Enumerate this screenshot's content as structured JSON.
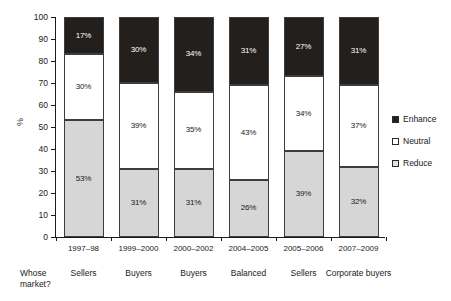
{
  "chart_data": {
    "type": "bar",
    "title": "",
    "subtitle": "",
    "xlabel": "",
    "ylabel": "%",
    "ylim": [
      0,
      100
    ],
    "ytick_step": 10,
    "yticks": [
      0,
      10,
      20,
      30,
      40,
      50,
      60,
      70,
      80,
      90,
      100
    ],
    "ytick_labels": [
      "0",
      "10",
      "20",
      "30",
      "40",
      "50",
      "60",
      "70",
      "80",
      "90",
      "100"
    ],
    "grid": false,
    "stacked": true,
    "stack_order_bottom_to_top": [
      "Reduce",
      "Neutral",
      "Enhance"
    ],
    "legend_position": "right",
    "categories": [
      "1997–98",
      "1999–2000",
      "2000–2002",
      "2004–2005",
      "2005–2006",
      "2007–2009"
    ],
    "series": [
      {
        "name": "Enhance",
        "color": "#231f1d",
        "values": [
          17,
          30,
          34,
          31,
          27,
          31
        ],
        "labels": [
          "17%",
          "30%",
          "34%",
          "31%",
          "27%",
          "31%"
        ]
      },
      {
        "name": "Neutral",
        "color": "#ffffff",
        "values": [
          30,
          39,
          35,
          43,
          34,
          37
        ],
        "labels": [
          "30%",
          "39%",
          "35%",
          "43%",
          "34%",
          "37%"
        ]
      },
      {
        "name": "Reduce",
        "color": "#d6d6d6",
        "values": [
          53,
          31,
          31,
          26,
          39,
          32
        ],
        "labels": [
          "53%",
          "31%",
          "31%",
          "26%",
          "39%",
          "32%"
        ]
      }
    ]
  },
  "footer": {
    "title": "Whose market?",
    "cells": [
      "Sellers",
      "Buyers",
      "Buyers",
      "Balanced",
      "Sellers",
      "Corporate buyers"
    ]
  },
  "legend": {
    "items": [
      {
        "label": "Enhance",
        "swatch": "enhance"
      },
      {
        "label": "Neutral",
        "swatch": "neutral"
      },
      {
        "label": "Reduce",
        "swatch": "reduce"
      }
    ]
  }
}
